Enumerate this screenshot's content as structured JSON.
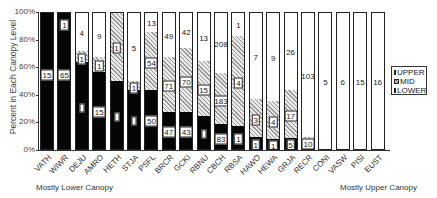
{
  "chart_data": {
    "type": "bar",
    "stacked": true,
    "percent": true,
    "title": "",
    "xlabel": "",
    "ylabel": "Percent in Each Canopy Level",
    "ylim": [
      0,
      100
    ],
    "yticks": [
      "0%",
      "20%",
      "40%",
      "60%",
      "80%",
      "100%"
    ],
    "categories": [
      "VATH",
      "WIWR",
      "DEJU",
      "AMRO",
      "HETH",
      "STJA",
      "PSFL",
      "BRCR",
      "GCKI",
      "RBNU",
      "CBCH",
      "RBSA",
      "HAWO",
      "HEWA",
      "GRJA",
      "RECR",
      "CONI",
      "VASW",
      "PISI",
      "EUST"
    ],
    "series": [
      {
        "name": "LOWER",
        "values": [
          100,
          100,
          63,
          56,
          49,
          43,
          43,
          27,
          27,
          24,
          18,
          17,
          9,
          7,
          8,
          1,
          0,
          0,
          0,
          0
        ]
      },
      {
        "name": "MID",
        "values": [
          0,
          0,
          8,
          11,
          51,
          6,
          42,
          40,
          46,
          40,
          37,
          65,
          27,
          28,
          35,
          8,
          0,
          0,
          0,
          0
        ]
      },
      {
        "name": "UPPER",
        "values": [
          0,
          0,
          29,
          33,
          0,
          51,
          15,
          33,
          27,
          36,
          45,
          18,
          64,
          65,
          57,
          91,
          100,
          100,
          100,
          100
        ]
      }
    ],
    "segment_labels": {
      "LOWER": [
        "15",
        "65",
        "",
        "15",
        "",
        "",
        "50",
        "47",
        "43",
        "",
        "83",
        "1",
        "1",
        "1",
        "5",
        "",
        "",
        "",
        "",
        ""
      ],
      "MID": [
        "",
        "1",
        "1",
        "1",
        "1",
        "1",
        "54",
        "71",
        "70",
        "15",
        "183",
        "4",
        "3",
        "4",
        "17",
        "10",
        "",
        "",
        "",
        ""
      ],
      "UPPER": [
        "",
        "",
        "4",
        "9",
        "",
        "5",
        "13",
        "49",
        "42",
        "13",
        "208",
        "1",
        "7",
        "9",
        "26",
        "103",
        "5",
        "6",
        "15",
        "16"
      ]
    },
    "legend": [
      "UPPER",
      "MID",
      "LOWER"
    ],
    "legend_position": "right",
    "annotations": [
      "Mostly Lower Canopy",
      "Mostly Upper Canopy"
    ],
    "grid": false
  },
  "axis": {
    "ylabel": "Percent in Each Canopy Level",
    "ticks": [
      "100%",
      "80%",
      "60%",
      "40%",
      "20%",
      "0%"
    ]
  },
  "legend": {
    "upper": "UPPER",
    "mid": "MID",
    "lower": "LOWER"
  },
  "footer": {
    "left": "Mostly Lower Canopy",
    "right": "Mostly Upper Canopy"
  }
}
